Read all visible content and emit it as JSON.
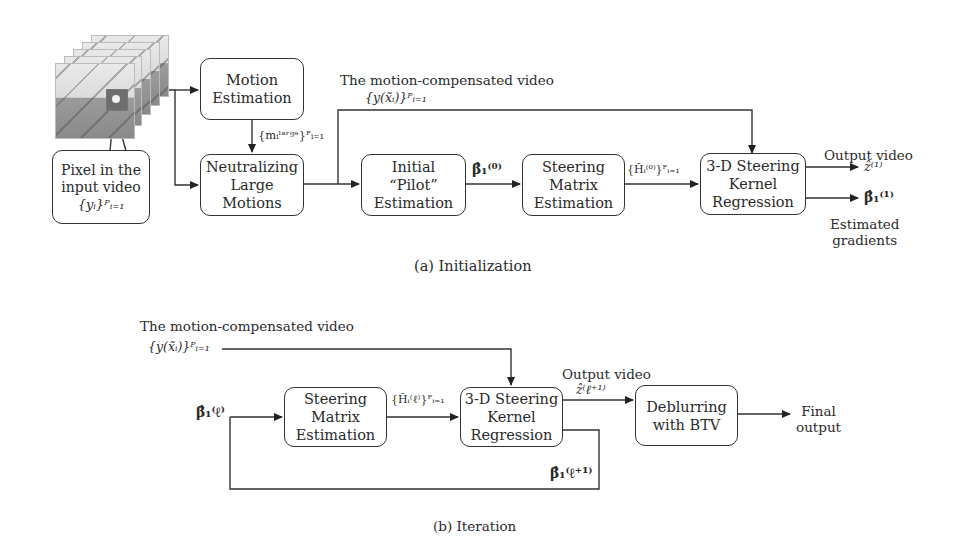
{
  "part_a": {
    "caption": "(a) Initialization",
    "input": {
      "callout_lines": [
        "Pixel in the",
        "input video"
      ],
      "callout_math": "{yᵢ}ᴾᵢ₌₁"
    },
    "blocks": {
      "motion_estimation": [
        "Motion",
        "Estimation"
      ],
      "neutralizing": [
        "Neutralizing",
        "Large",
        "Motions"
      ],
      "initial_pilot": [
        "Initial",
        "“Pilot”",
        "Estimation"
      ],
      "steering_matrix": [
        "Steering",
        "Matrix",
        "Estimation"
      ],
      "kernel_regression": [
        "3-D Steering",
        "Kernel",
        "Regression"
      ]
    },
    "labels": {
      "motion_compensated": "The motion-compensated video",
      "motion_compensated_math": "{y(x̃ᵢ)}ᴾᵢ₌₁",
      "large_motion_math": "{mᵢˡᵃʳᵍᵉ}ᴾᵢ₌₁",
      "beta0": "β̂₁⁽⁰⁾",
      "H0": "{H̃ᵢ⁽⁰⁾}ᴾᵢ₌₁",
      "output_video": "Output video",
      "z1": "ẑ⁽¹⁾",
      "beta1": "β̂₁⁽¹⁾",
      "estimated_gradients": [
        "Estimated",
        "gradients"
      ]
    }
  },
  "part_b": {
    "caption": "(b) Iteration",
    "blocks": {
      "steering_matrix": [
        "Steering",
        "Matrix",
        "Estimation"
      ],
      "kernel_regression": [
        "3-D Steering",
        "Kernel",
        "Regression"
      ],
      "deblurring": [
        "Deblurring",
        "with BTV"
      ]
    },
    "labels": {
      "motion_compensated": "The motion-compensated video",
      "motion_compensated_math": "{y(x̃ᵢ)}ᴾᵢ₌₁",
      "beta_l": "β̂₁⁽ℓ⁾",
      "H_l": "{H̃ᵢ⁽ℓ⁾}ᴾᵢ₌₁",
      "output_video": "Output video",
      "z_l1": "ẑ⁽ℓ⁺¹⁾",
      "beta_l1": "β̂₁⁽ℓ⁺¹⁾",
      "final_output": [
        "Final",
        "output"
      ]
    }
  }
}
